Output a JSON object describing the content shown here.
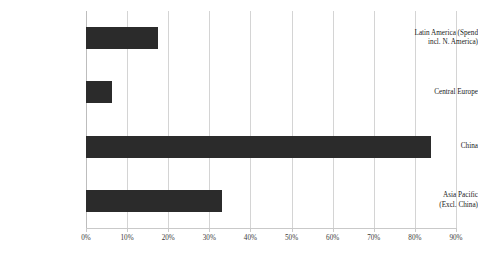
{
  "chart_data": {
    "type": "bar",
    "orientation": "horizontal",
    "title": "",
    "subtitle": "",
    "xlabel": "",
    "ylabel": "",
    "categories": [
      "Latin America (Spend incl. N. America)",
      "Central Europe",
      "China",
      "Asia Pacific (Excl. China)"
    ],
    "values": [
      17.5,
      6.3,
      84.0,
      33.0
    ],
    "xlim": [
      0,
      90
    ],
    "xtick_values": [
      0,
      10,
      20,
      30,
      40,
      50,
      60,
      70,
      80,
      90
    ],
    "xtick_labels": [
      "0%",
      "10%",
      "20%",
      "30%",
      "40%",
      "50%",
      "60%",
      "70%",
      "80%",
      "90%"
    ],
    "grid": "vertical",
    "legend": "none",
    "series": [
      {
        "name": "Share",
        "color": "#2b2b2b",
        "values": [
          17.5,
          6.3,
          84.0,
          33.0
        ]
      }
    ]
  },
  "axis": {
    "category_labels": [
      {
        "lines": [
          "Latin America (Spend",
          "incl. N. America)"
        ]
      },
      {
        "lines": [
          "Central Europe"
        ]
      },
      {
        "lines": [
          "China"
        ]
      },
      {
        "lines": [
          "Asia Pacific",
          "(Excl. China)"
        ]
      }
    ],
    "tick_labels": [
      "0%",
      "10%",
      "20%",
      "30%",
      "40%",
      "50%",
      "60%",
      "70%",
      "80%",
      "90%"
    ]
  },
  "colors": {
    "bar": "#2b2b2b",
    "gridline": "#d4d4d4",
    "axis": "#c9c9c9",
    "background": "#ffffff",
    "text": "#1a1a1a"
  }
}
